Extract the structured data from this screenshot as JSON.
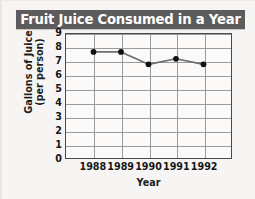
{
  "chart_data": {
    "type": "line",
    "title": "Fruit Juice Consumed in a Year",
    "xlabel": "Year",
    "ylabel_line1": "Gallons of Juice",
    "ylabel_line2": "(per person)",
    "categories": [
      "1988",
      "1989",
      "1990",
      "1991",
      "1992"
    ],
    "values": [
      7.7,
      7.7,
      6.8,
      7.2,
      6.8
    ],
    "series": [
      {
        "name": "Gallons of juice per person",
        "values": [
          7.7,
          7.7,
          6.8,
          7.2,
          6.8
        ]
      }
    ],
    "yticks": [
      "0",
      "1",
      "2",
      "3",
      "4",
      "5",
      "6",
      "7",
      "8",
      "9"
    ],
    "ylim": [
      0,
      9
    ],
    "grid": true,
    "legend": "none",
    "marker": "filled-circle",
    "colors": {
      "title_banner_background": "#5c5c5c",
      "title_text": "#ffffff",
      "line": "#6e6e6e",
      "marker": "#111111",
      "grid": "#9b9b9b",
      "frame": "#4a4a4a",
      "page_background": "#f6f5f3",
      "plot_background": "#fbfaf9"
    }
  }
}
